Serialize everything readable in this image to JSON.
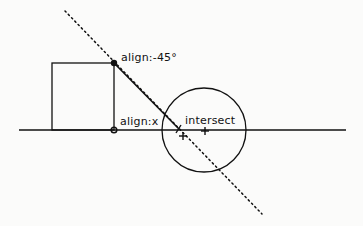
{
  "diagram": {
    "labels": {
      "align_angle": "align:-45°",
      "align_x": "align:x",
      "intersect": "intersect"
    },
    "colors": {
      "stroke": "#111111",
      "background": "#fbfbfa"
    }
  }
}
